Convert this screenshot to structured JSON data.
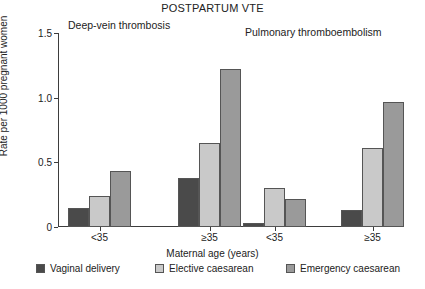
{
  "chart_data": {
    "type": "bar",
    "title": "POSTPARTUM VTE",
    "xlabel": "Maternal age (years)",
    "ylabel": "Rate per 1000 pregnant women",
    "ylim": [
      0,
      1.5
    ],
    "yticks": [
      "0",
      "0.5",
      "1.0",
      "1.5"
    ],
    "ytick_values": [
      0,
      0.5,
      1.0,
      1.5
    ],
    "grid": false,
    "legend_position": "bottom",
    "panels": [
      {
        "label": "Deep-vein thrombosis",
        "categories": [
          "<35",
          "≥35"
        ]
      },
      {
        "label": "Pulmonary thromboembolism",
        "categories": [
          "<35",
          "≥35"
        ]
      }
    ],
    "categories": [
      "<35",
      "≥35",
      "<35",
      "≥35"
    ],
    "series": [
      {
        "name": "Vaginal delivery",
        "color": "#4a4a4a",
        "values": [
          0.15,
          0.38,
          0.03,
          0.13
        ]
      },
      {
        "name": "Elective caesarean",
        "color": "#c9c9c9",
        "values": [
          0.24,
          0.65,
          0.3,
          0.61
        ]
      },
      {
        "name": "Emergency caesarean",
        "color": "#9a9a9a",
        "values": [
          0.43,
          1.22,
          0.22,
          0.97
        ]
      }
    ]
  }
}
